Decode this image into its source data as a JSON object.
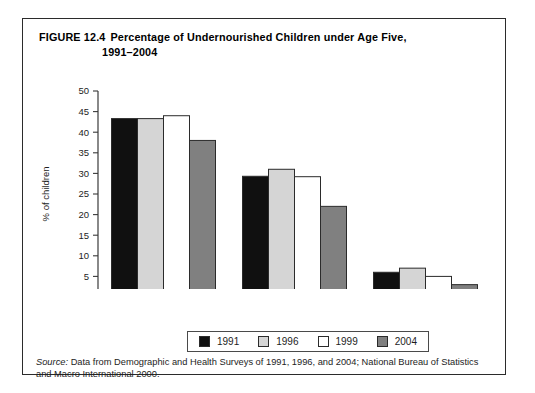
{
  "figure": {
    "label": "FIGURE 12.4",
    "title_line1": "Percentage of Undernourished Children under Age Five,",
    "title_line2": "1991–2004",
    "source_label": "Source:",
    "source_text": " Data from Demographic and Health Surveys of 1991, 1996, and 2004; National Bureau of Statistics and Macro International 2000."
  },
  "legend": {
    "items": [
      {
        "label": "1991",
        "color": "#101010"
      },
      {
        "label": "1996",
        "color": "#d5d5d5"
      },
      {
        "label": "1999",
        "color": "#ffffff"
      },
      {
        "label": "2004",
        "color": "#808080"
      }
    ]
  },
  "chart_data": {
    "type": "bar",
    "title": "Percentage of Undernourished Children under Age Five, 1991–2004",
    "xlabel": "",
    "ylabel": "% of children",
    "categories": [
      "stunting",
      "underweight",
      "wasting"
    ],
    "series": [
      {
        "name": "1991",
        "color": "#101010",
        "values": [
          43.3,
          29.3,
          6.0
        ]
      },
      {
        "name": "1996",
        "color": "#d5d5d5",
        "values": [
          43.3,
          31.0,
          7.0
        ]
      },
      {
        "name": "1999",
        "color": "#ffffff",
        "values": [
          44.0,
          29.2,
          5.0
        ]
      },
      {
        "name": "2004",
        "color": "#808080",
        "values": [
          38.0,
          22.0,
          3.0
        ]
      }
    ],
    "ylim": [
      0,
      50
    ],
    "yticks": [
      0,
      5,
      10,
      15,
      20,
      25,
      30,
      35,
      40,
      45,
      50
    ],
    "ytick_labels": [
      "0",
      "5",
      "10",
      "15",
      "20",
      "25",
      "30",
      "35",
      "40",
      "45",
      "50"
    ],
    "grid": false,
    "legend_position": "bottom"
  }
}
